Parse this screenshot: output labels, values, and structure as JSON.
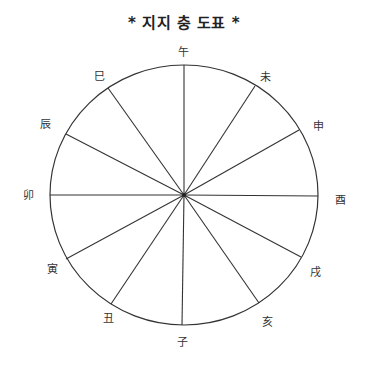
{
  "title": "* 지지 충 도표 *",
  "colors": {
    "line": "#333333",
    "text": "#222222",
    "background": "#ffffff"
  },
  "circle": {
    "cx": 184,
    "cy": 195,
    "rx": 134,
    "ry": 130
  },
  "branches": [
    {
      "label": "午",
      "spoke_end": [
        184,
        65
      ],
      "label_pos": [
        183,
        56
      ]
    },
    {
      "label": "未",
      "spoke_end": [
        255,
        86
      ],
      "label_pos": [
        265,
        81
      ]
    },
    {
      "label": "申",
      "spoke_end": [
        299,
        130
      ],
      "label_pos": [
        318,
        130
      ]
    },
    {
      "label": "酉",
      "spoke_end": [
        318,
        196
      ],
      "label_pos": [
        340,
        204
      ]
    },
    {
      "label": "戌",
      "spoke_end": [
        301,
        257
      ],
      "label_pos": [
        315,
        276
      ]
    },
    {
      "label": "亥",
      "spoke_end": [
        259,
        303
      ],
      "label_pos": [
        267,
        326
      ]
    },
    {
      "label": "子",
      "spoke_end": [
        182,
        325
      ],
      "label_pos": [
        182,
        346
      ]
    },
    {
      "label": "丑",
      "spoke_end": [
        111,
        304
      ],
      "label_pos": [
        108,
        322
      ]
    },
    {
      "label": "寅",
      "spoke_end": [
        66,
        259
      ],
      "label_pos": [
        52,
        273
      ]
    },
    {
      "label": "卯",
      "spoke_end": [
        50,
        195
      ],
      "label_pos": [
        28,
        199
      ]
    },
    {
      "label": "辰",
      "spoke_end": [
        66,
        134
      ],
      "label_pos": [
        45,
        128
      ]
    },
    {
      "label": "巳",
      "spoke_end": [
        108,
        88
      ],
      "label_pos": [
        99,
        80
      ]
    }
  ]
}
